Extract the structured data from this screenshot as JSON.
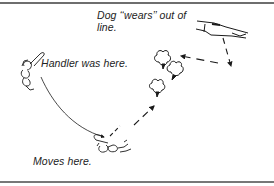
{
  "diagram": {
    "captions": {
      "dog_wears": "Dog ‘‘wears’’ out of",
      "dog_wears_line2": "line.",
      "handler_was_here": "Handler was here.",
      "moves_here": "Moves here."
    },
    "figures": [
      {
        "name": "handler-start",
        "label": "Handler (original position)"
      },
      {
        "name": "dog-out-of-line",
        "label": "Dog wearing out of line"
      },
      {
        "name": "sheep-group",
        "label": "Sheep being worn"
      },
      {
        "name": "handler-end",
        "label": "Handler (new position)"
      }
    ],
    "paths": [
      {
        "name": "handler-move-curve",
        "style": "solid"
      },
      {
        "name": "dog-wear-path",
        "style": "dashed"
      }
    ],
    "colors": {
      "ink": "#1a1a1a",
      "border": "#6e6e6e",
      "background": "#ffffff"
    }
  }
}
